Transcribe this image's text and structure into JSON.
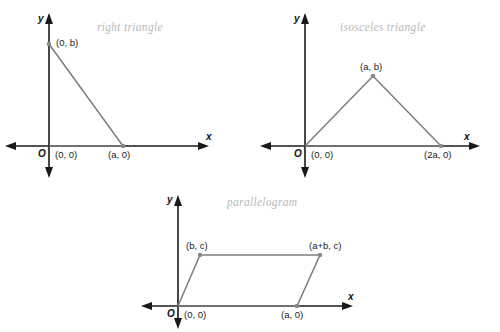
{
  "figures": [
    {
      "id": "right-triangle",
      "title": "right triangle",
      "axis_x_label": "x",
      "axis_y_label": "y",
      "origin_label": "O",
      "vertices": [
        {
          "name": "y-intercept",
          "label": "(0, b)"
        },
        {
          "name": "origin",
          "label": "(0, 0)"
        },
        {
          "name": "x-intercept",
          "label": "(a, 0)"
        }
      ]
    },
    {
      "id": "isosceles-triangle",
      "title": "isosceles triangle",
      "axis_x_label": "x",
      "axis_y_label": "y",
      "origin_label": "O",
      "vertices": [
        {
          "name": "apex",
          "label": "(a, b)"
        },
        {
          "name": "origin",
          "label": "(0, 0)"
        },
        {
          "name": "right-base",
          "label": "(2a, 0)"
        }
      ]
    },
    {
      "id": "parallelogram",
      "title": "parallelogram",
      "axis_x_label": "x",
      "axis_y_label": "y",
      "origin_label": "O",
      "vertices": [
        {
          "name": "top-left",
          "label": "(b, c)"
        },
        {
          "name": "top-right",
          "label": "(a+b, c)"
        },
        {
          "name": "origin",
          "label": "(0, 0)"
        },
        {
          "name": "bottom-right",
          "label": "(a, 0)"
        }
      ]
    }
  ],
  "colors": {
    "background": "#ffffff",
    "axis": "#1a1a1a",
    "shape_stroke": "#7d7d7d",
    "vertex_dot": "#8a8a8a",
    "title_text": "#b9b9b9",
    "coord_text": "#1c1c1c"
  }
}
